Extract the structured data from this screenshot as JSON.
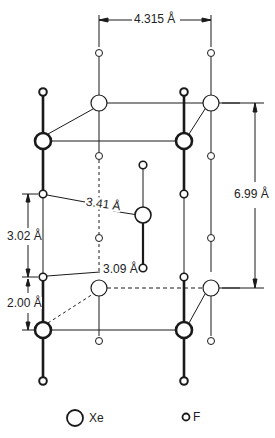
{
  "diagram": {
    "dimensions": {
      "a": "4.315 Å",
      "c": "6.99 Å",
      "xe_f_long": "3.02 Å",
      "xe_f_bond": "2.00 Å",
      "f_f_a": "3.41 Å",
      "f_f_b": "3.09 Å"
    },
    "legend": {
      "xe_label": "Xe",
      "f_label": "F"
    },
    "colors": {
      "stroke": "#1a1a1a",
      "background": "#ffffff"
    }
  }
}
